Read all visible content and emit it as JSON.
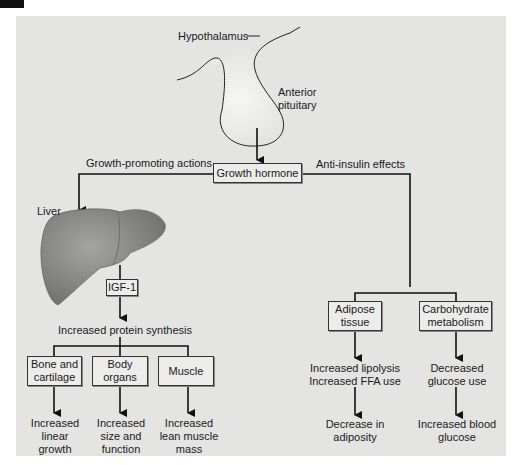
{
  "diagram": {
    "source": {
      "hypothalamus_label": "Hypothalamus",
      "pituitary_label": "Anterior pituitary",
      "pituitary_label_line1": "Anterior",
      "pituitary_label_line2": "pituitary",
      "hormone_box": "Growth hormone"
    },
    "left_branch": {
      "label": "Growth-promoting actions",
      "organ_label": "Liver",
      "mediator_box": "IGF-1",
      "effect": "Increased protein synthesis",
      "targets": [
        {
          "box_line1": "Bone and",
          "box_line2": "cartilage",
          "outcome_line1": "Increased",
          "outcome_line2": "linear",
          "outcome_line3": "growth"
        },
        {
          "box_line1": "Body",
          "box_line2": "organs",
          "outcome_line1": "Increased",
          "outcome_line2": "size and",
          "outcome_line3": "function"
        },
        {
          "box_line1": "Muscle",
          "box_line2": "",
          "outcome_line1": "Increased",
          "outcome_line2": "lean muscle",
          "outcome_line3": "mass"
        }
      ]
    },
    "right_branch": {
      "label": "Anti-insulin effects",
      "targets": [
        {
          "box_line1": "Adipose",
          "box_line2": "tissue",
          "effect_line1": "Increased lipolysis",
          "effect_line2": "Increased FFA use",
          "outcome_line1": "Decrease in",
          "outcome_line2": "adiposity"
        },
        {
          "box_line1": "Carbohydrate",
          "box_line2": "metabolism",
          "effect_line1": "Decreased",
          "effect_line2": "glucose use",
          "outcome_line1": "Increased blood",
          "outcome_line2": "glucose"
        }
      ]
    },
    "colors": {
      "panel_bg": "#e4e4e2",
      "box_bg": "#ececea",
      "line": "#111111",
      "liver": "#8a8a88",
      "pituitary": "#ededeb"
    }
  }
}
